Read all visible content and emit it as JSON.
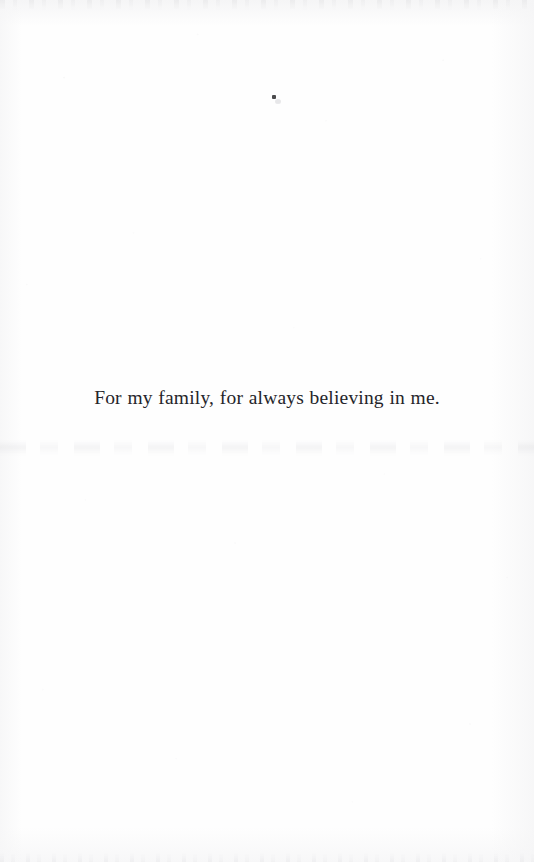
{
  "page": {
    "kind": "book-dedication-page",
    "width": 534,
    "height": 862,
    "background_color": "#fefefe",
    "text_color": "#25252a"
  },
  "dedication": {
    "text": "For my family, for always believing in me."
  },
  "artifacts": {
    "ink_speck": {
      "name": "ink-speck",
      "x": 272,
      "y": 95,
      "color": "#3c3c3e"
    },
    "bleed_through": {
      "name": "reverse-page-show-through",
      "y": 440,
      "legible": "no"
    },
    "scan_edge_top": {
      "name": "scan-edge-noise-top"
    },
    "scan_edge_bottom": {
      "name": "scan-edge-noise-bottom"
    }
  }
}
